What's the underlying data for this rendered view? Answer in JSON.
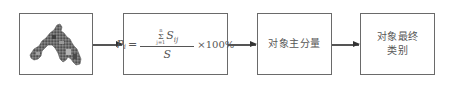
{
  "diagram": {
    "type": "flowchart",
    "direction": "left-to-right",
    "nodes": [
      {
        "id": "input-image",
        "kind": "image",
        "description": "grayscale raster map of study region"
      },
      {
        "id": "formula",
        "kind": "formula",
        "formula": {
          "lhs_var": "p",
          "lhs_sub": "i",
          "equals": "=",
          "sum_upper": "n",
          "sum_symbol": "Σ",
          "sum_lower": "j=1",
          "term_var": "S",
          "term_sub": "ij",
          "denominator": "S",
          "multiplier": "×100%"
        }
      },
      {
        "id": "main-component",
        "kind": "process",
        "label": "对象主分量"
      },
      {
        "id": "final-class",
        "kind": "output",
        "label_line1": "对象最终",
        "label_line2": "类别"
      }
    ],
    "edges": [
      {
        "from": "input-image",
        "to": "formula"
      },
      {
        "from": "formula",
        "to": "main-component"
      },
      {
        "from": "main-component",
        "to": "final-class"
      }
    ],
    "colors": {
      "border": "#6a6a6a",
      "text": "#555555",
      "arrow": "#555555"
    }
  }
}
